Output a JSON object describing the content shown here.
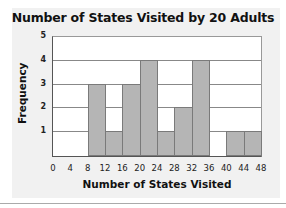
{
  "chart_data": {
    "type": "bar",
    "title": "Number of States Visited by 20 Adults",
    "xlabel": "Number of States Visited",
    "ylabel": "Frequency",
    "bin_edges": [
      0,
      4,
      8,
      12,
      16,
      20,
      24,
      28,
      32,
      36,
      40,
      44,
      48
    ],
    "categories": [
      "0-4",
      "4-8",
      "8-12",
      "12-16",
      "16-20",
      "20-24",
      "24-28",
      "28-32",
      "32-36",
      "36-40",
      "40-44",
      "44-48"
    ],
    "values": [
      0,
      0,
      3,
      1,
      3,
      4,
      1,
      2,
      4,
      0,
      1,
      1
    ],
    "ylim": [
      0,
      5
    ],
    "xlim": [
      0,
      48
    ],
    "yticks": [
      1,
      2,
      3,
      4,
      5
    ],
    "xticks": [
      0,
      4,
      8,
      12,
      16,
      20,
      24,
      28,
      32,
      36,
      40,
      44,
      48
    ],
    "grid": true,
    "histogram": true,
    "bar_color": "#b5b5b5"
  }
}
